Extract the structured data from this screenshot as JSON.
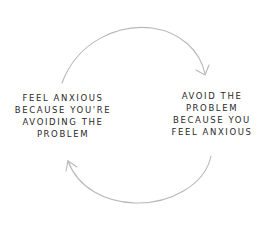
{
  "diagram": {
    "type": "cycle",
    "nodes": [
      {
        "id": "left",
        "lines": [
          "FEEL ANXIOUS",
          "BECAUSE YOU'RE",
          "AVOIDING THE",
          "PROBLEM"
        ]
      },
      {
        "id": "right",
        "lines": [
          "AVOID THE",
          "PROBLEM",
          "BECAUSE YOU",
          "FEEL ANXIOUS"
        ]
      }
    ],
    "edges": [
      {
        "from": "left",
        "to": "right",
        "position": "top"
      },
      {
        "from": "right",
        "to": "left",
        "position": "bottom"
      }
    ],
    "colors": {
      "text": "#2a2a2a",
      "arrow": "#b8b8b8",
      "background": "#ffffff"
    }
  }
}
